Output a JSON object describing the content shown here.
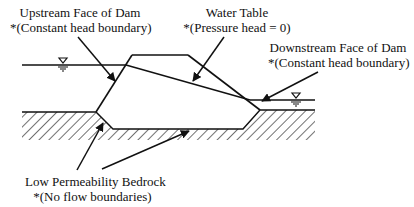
{
  "diagram": {
    "type": "earth-dam-seepage-cross-section",
    "labels": {
      "upstream_face": {
        "title": "Upstream Face of Dam",
        "note": "*(Constant head boundary)"
      },
      "water_table": {
        "title": "Water Table",
        "note": "*(Pressure head = 0)"
      },
      "downstream_face": {
        "title": "Downstream Face of Dam",
        "note": "*(Constant head boundary)"
      },
      "bedrock": {
        "title": "Low Permeability Bedrock",
        "note": "*(No flow boundaries)"
      }
    },
    "symbols": {
      "upstream_water_level": "water-surface-triangle",
      "downstream_water_level": "water-surface-triangle"
    },
    "colors": {
      "line": "#111111",
      "background": "#ffffff"
    }
  }
}
